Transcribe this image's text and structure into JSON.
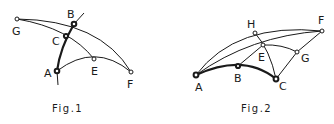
{
  "figures": [
    {
      "caption": "Fig.1",
      "points": {
        "A": "A",
        "B": "B",
        "C": "C",
        "E": "E",
        "F": "F",
        "G": "G"
      }
    },
    {
      "caption": "Fig.2",
      "points": {
        "A": "A",
        "B": "B",
        "C": "C",
        "E": "E",
        "F": "F",
        "G": "G",
        "H": "H"
      }
    }
  ],
  "colors": {
    "ink": "#1a1a1a",
    "background": "#ffffff"
  }
}
